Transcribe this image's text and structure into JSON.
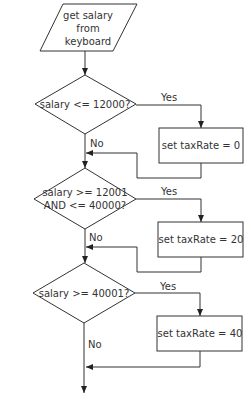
{
  "diagram": {
    "type": "flowchart",
    "colors": {
      "stroke": "#333333",
      "fill": "#ffffff",
      "text": "#333333"
    },
    "input": {
      "lines": [
        "get salary",
        "from",
        "keyboard"
      ]
    },
    "decisions": [
      {
        "lines": [
          "salary <= 12000?"
        ],
        "yes_label": "Yes",
        "no_label": "No"
      },
      {
        "lines": [
          "salary >= 12001",
          "AND <= 40000?"
        ],
        "yes_label": "Yes",
        "no_label": "No"
      },
      {
        "lines": [
          "salary >= 40001?"
        ],
        "yes_label": "Yes",
        "no_label": "No"
      }
    ],
    "processes": [
      {
        "label": "set taxRate = 0"
      },
      {
        "label": "set taxRate = 20"
      },
      {
        "label": "set taxRate = 40"
      }
    ]
  }
}
